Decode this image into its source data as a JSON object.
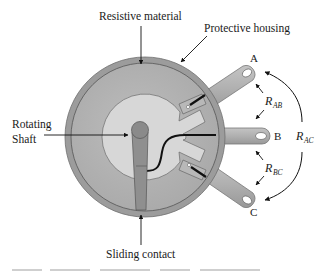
{
  "labels": {
    "resistive_material": "Resistive material",
    "protective_housing": "Protective housing",
    "rotating_shaft_line1": "Rotating",
    "rotating_shaft_line2": "Shaft",
    "sliding_contact": "Sliding contact"
  },
  "terminals": {
    "a": "A",
    "b": "B",
    "c": "C"
  },
  "resistances": {
    "ab": {
      "main": "R",
      "sub": "AB"
    },
    "bc": {
      "main": "R",
      "sub": "BC"
    },
    "ac": {
      "main": "R",
      "sub": "AC"
    }
  },
  "colors": {
    "housing": "#9a9a9a",
    "resistive": "#b4b4b4",
    "inner_disc": "#d6d6d6",
    "shaft": "#8c8c8c",
    "terminal": "#a8a8a8",
    "ink": "#111111"
  }
}
